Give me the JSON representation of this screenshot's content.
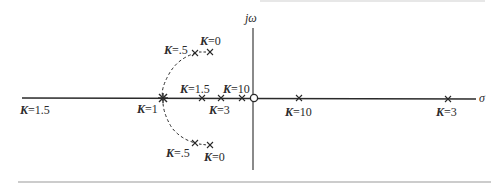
{
  "figure": {
    "type": "root-locus",
    "axes": {
      "real_axis_label": "σ",
      "imag_axis_label": "jω"
    },
    "colors": {
      "ink": "#2a2a2a",
      "background": "#ffffff"
    },
    "real_axis_gain_labels": [
      {
        "id": "k15-left",
        "k": "K",
        "eq": "=1.5"
      },
      {
        "id": "k1",
        "k": "K",
        "eq": "=1"
      },
      {
        "id": "k15",
        "k": "K",
        "eq": "=1.5"
      },
      {
        "id": "k3-inner",
        "k": "K",
        "eq": "=3"
      },
      {
        "id": "k10-inner",
        "k": "K",
        "eq": "=10"
      },
      {
        "id": "k10-right",
        "k": "K",
        "eq": "=10"
      },
      {
        "id": "k3-right",
        "k": "K",
        "eq": "=3"
      }
    ],
    "upper_branch_labels": [
      {
        "id": "k05-upper",
        "k": "K",
        "eq": "=.5"
      },
      {
        "id": "k0-upper",
        "k": "K",
        "eq": "=0"
      }
    ],
    "lower_branch_labels": [
      {
        "id": "k05-lower",
        "k": "K",
        "eq": "=.5"
      },
      {
        "id": "k0-lower",
        "k": "K",
        "eq": "=0"
      }
    ],
    "markers": {
      "poles": "x",
      "zero": "o",
      "breakaway": "*"
    }
  }
}
